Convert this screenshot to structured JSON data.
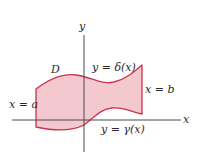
{
  "diagram": {
    "axes": {
      "x_label": "x",
      "y_label": "y",
      "color": "#4a4a4a"
    },
    "region": {
      "label": "D",
      "fill_color": "#f4c8cf",
      "stroke_color": "#c9334c"
    },
    "boundaries": {
      "left": "x = a",
      "right": "x = b",
      "top": "y = δ(x)",
      "bottom": "y = γ(x)"
    }
  }
}
